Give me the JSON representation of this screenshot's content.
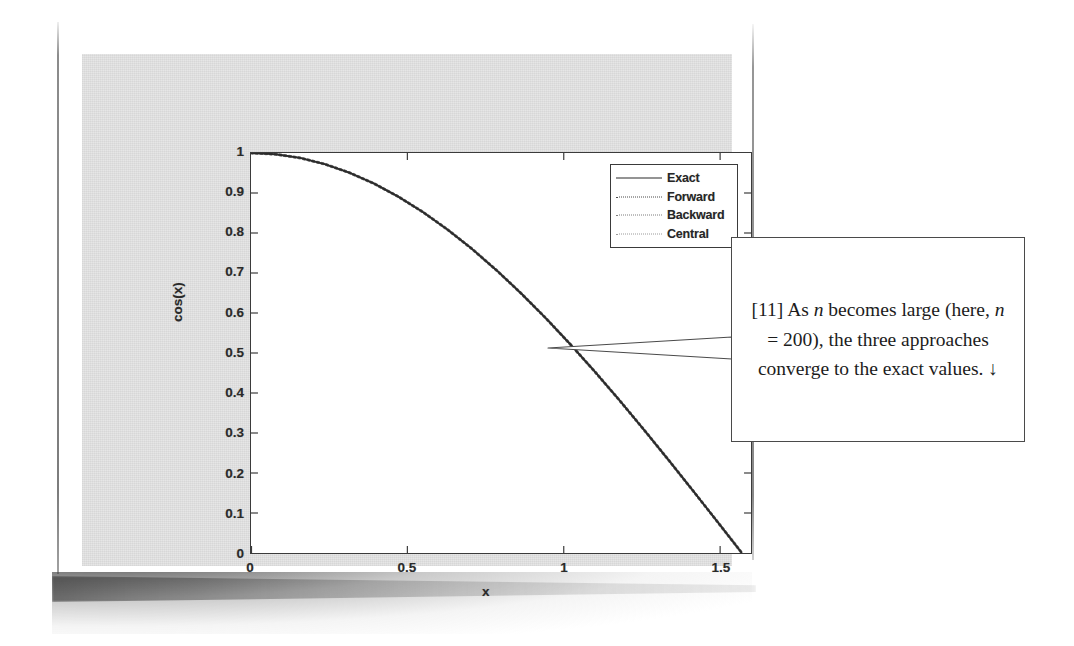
{
  "figure": {
    "axes": {
      "xlabel": "x",
      "ylabel": "cos(x)",
      "xticks": [
        "0",
        "0.5",
        "1",
        "1.5"
      ],
      "yticks": [
        "1",
        "0.9",
        "0.8",
        "0.7",
        "0.6",
        "0.5",
        "0.4",
        "0.3",
        "0.2",
        "0.1",
        "0"
      ],
      "xlim": [
        0,
        1.6
      ],
      "ylim": [
        0,
        1
      ]
    },
    "legend": {
      "entries": [
        {
          "label": "Exact",
          "style": "solid"
        },
        {
          "label": "Forward",
          "style": "dotted"
        },
        {
          "label": "Backward",
          "style": "dotted"
        },
        {
          "label": "Central",
          "style": "dotted"
        }
      ]
    }
  },
  "callout": {
    "prefix": "[11] As ",
    "italic1": "n",
    "mid1": " becomes large (here, ",
    "italic2": "n",
    "mid2": " = 200), the three approaches converge to the exact values. ",
    "arrow": "↓",
    "full_text": "[11] As n becomes large (here, n = 200), the three approaches converge to the exact values. ↓"
  },
  "colors": {
    "figure_background": "#e4e4e4",
    "plot_background": "#ffffff",
    "axis_line": "#3b3b3b",
    "curve": "#2b2b2b",
    "page_background": "#ffffff",
    "callout_border": "#4a4a4a"
  },
  "chart_data": {
    "type": "line",
    "title": "",
    "xlabel": "x",
    "ylabel": "cos(x)",
    "xlim": [
      0,
      1.6
    ],
    "ylim": [
      0,
      1
    ],
    "xticks": [
      0,
      0.5,
      1,
      1.5
    ],
    "yticks": [
      0,
      0.1,
      0.2,
      0.3,
      0.4,
      0.5,
      0.6,
      0.7,
      0.8,
      0.9,
      1
    ],
    "grid": false,
    "legend_position": "upper right",
    "x": [
      0,
      0.0785,
      0.1571,
      0.2356,
      0.3142,
      0.3927,
      0.4712,
      0.5498,
      0.6283,
      0.7069,
      0.7854,
      0.8639,
      0.9425,
      1.021,
      1.0996,
      1.1781,
      1.2566,
      1.3352,
      1.4137,
      1.4923,
      1.5708
    ],
    "series": [
      {
        "name": "Exact",
        "style": "solid",
        "values": [
          1.0,
          0.9969,
          0.9877,
          0.9724,
          0.9511,
          0.9239,
          0.891,
          0.8526,
          0.809,
          0.7604,
          0.7071,
          0.6494,
          0.5878,
          0.5225,
          0.454,
          0.3827,
          0.309,
          0.2334,
          0.1564,
          0.0785,
          0.0
        ]
      },
      {
        "name": "Forward",
        "style": "dotted",
        "values": [
          1.0,
          0.9969,
          0.9877,
          0.9724,
          0.9511,
          0.9239,
          0.891,
          0.8526,
          0.809,
          0.7604,
          0.7071,
          0.6494,
          0.5878,
          0.5225,
          0.454,
          0.3827,
          0.309,
          0.2334,
          0.1564,
          0.0785,
          0.0
        ]
      },
      {
        "name": "Backward",
        "style": "dotted",
        "values": [
          1.0,
          0.9969,
          0.9877,
          0.9724,
          0.9511,
          0.9239,
          0.891,
          0.8526,
          0.809,
          0.7604,
          0.7071,
          0.6494,
          0.5878,
          0.5225,
          0.454,
          0.3827,
          0.309,
          0.2334,
          0.1564,
          0.0785,
          0.0
        ]
      },
      {
        "name": "Central",
        "style": "dotted",
        "values": [
          1.0,
          0.9969,
          0.9877,
          0.9724,
          0.9511,
          0.9239,
          0.891,
          0.8526,
          0.809,
          0.7604,
          0.7071,
          0.6494,
          0.5878,
          0.5225,
          0.454,
          0.3827,
          0.309,
          0.2334,
          0.1564,
          0.0785,
          0.0
        ]
      }
    ],
    "annotations": [
      {
        "text": "[11] As n becomes large (here, n = 200), the three approaches converge to the exact values.",
        "points_to_x": 1.19,
        "points_to_y": 0.37
      }
    ]
  }
}
